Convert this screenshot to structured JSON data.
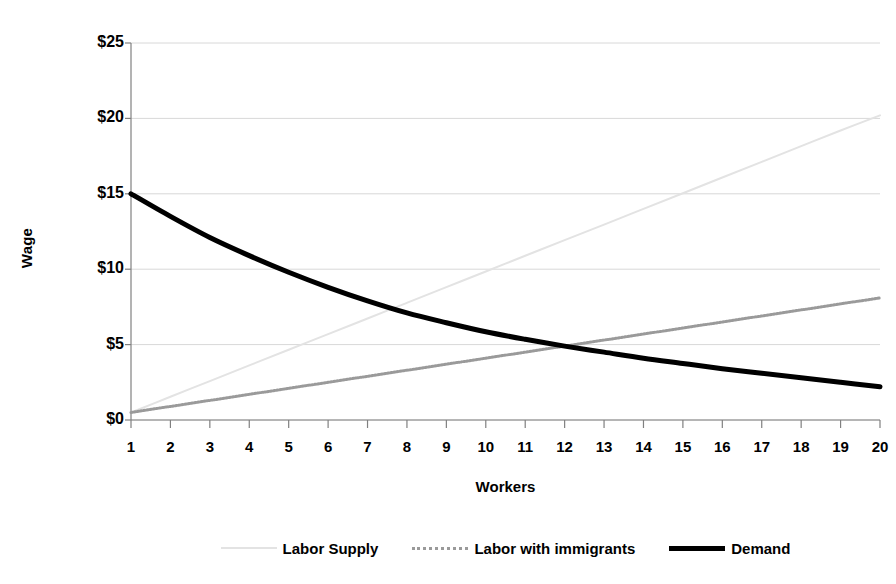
{
  "chart_data": {
    "type": "line",
    "title": "",
    "xlabel": "Workers",
    "ylabel": "Wage",
    "x": [
      1,
      2,
      3,
      4,
      5,
      6,
      7,
      8,
      9,
      10,
      11,
      12,
      13,
      14,
      15,
      16,
      17,
      18,
      19,
      20
    ],
    "xlim": [
      1,
      20
    ],
    "ylim": [
      0,
      25
    ],
    "ytick_labels": [
      "$0",
      "$5",
      "$10",
      "$15",
      "$20",
      "$25"
    ],
    "ytick_values": [
      0,
      5,
      10,
      15,
      20,
      25
    ],
    "xtick_labels": [
      "1",
      "2",
      "3",
      "4",
      "5",
      "6",
      "7",
      "8",
      "9",
      "10",
      "11",
      "12",
      "13",
      "14",
      "15",
      "16",
      "17",
      "18",
      "19",
      "20"
    ],
    "grid": true,
    "legend_position": "bottom",
    "series": [
      {
        "name": "Labor Supply",
        "color": "#e3e3e3",
        "style": "solid",
        "width": 2,
        "values": [
          0.5,
          1.54,
          2.58,
          3.62,
          4.66,
          5.69,
          6.73,
          7.77,
          8.81,
          9.85,
          10.89,
          11.93,
          12.96,
          14.0,
          15.04,
          16.08,
          17.12,
          18.16,
          19.2,
          20.2
        ]
      },
      {
        "name": "Labor with immigrants",
        "color": "#9a9a9a",
        "style": "dotted",
        "width": 3,
        "values": [
          0.5,
          0.9,
          1.3,
          1.7,
          2.1,
          2.5,
          2.9,
          3.3,
          3.7,
          4.1,
          4.5,
          4.9,
          5.3,
          5.7,
          6.1,
          6.5,
          6.9,
          7.3,
          7.7,
          8.1
        ]
      },
      {
        "name": "Demand",
        "color": "#000000",
        "style": "solid",
        "width": 5,
        "values": [
          15.0,
          13.5,
          12.1,
          10.9,
          9.8,
          8.8,
          7.9,
          7.1,
          6.45,
          5.85,
          5.35,
          4.9,
          4.5,
          4.1,
          3.75,
          3.4,
          3.1,
          2.8,
          2.5,
          2.2
        ]
      }
    ],
    "intersections": [
      {
        "label": "supply-demand-equilibrium",
        "x": 8.2,
        "y": 7.0
      },
      {
        "label": "immigrant-supply-demand-equilibrium",
        "x": 11.8,
        "y": 4.85
      }
    ]
  },
  "legend": {
    "items": [
      {
        "label": "Labor Supply",
        "icon": "line-swatch-light"
      },
      {
        "label": "Labor with immigrants",
        "icon": "line-swatch-dotted-gray"
      },
      {
        "label": "Demand",
        "icon": "line-swatch-black"
      }
    ]
  },
  "axes": {
    "y_title": "Wage",
    "x_title": "Workers"
  },
  "colors": {
    "background": "#ffffff",
    "grid": "#d8d8d8",
    "axis": "#808080",
    "text": "#000000",
    "supply": "#e3e3e3",
    "immigrants": "#9a9a9a",
    "demand": "#000000"
  }
}
